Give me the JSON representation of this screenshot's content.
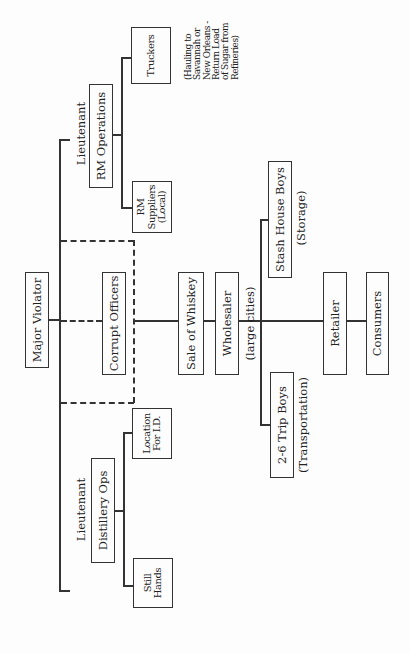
{
  "diagram": {
    "orientation": "rotated 90 degrees counter-clockwise",
    "nodes": {
      "major_violator": "Major Violator",
      "lieutenant_rm": {
        "title": "Lieutenant",
        "label": "RM Operations"
      },
      "lieutenant_distillery": {
        "title": "Lieutenant",
        "label": "Distillery Ops"
      },
      "corrupt_officers": "Corrupt Officers",
      "truckers": "Truckers",
      "truckers_note": [
        "(Hauling to",
        "Savannah or",
        "New Orleans -",
        "Return Load",
        "of Sugar from",
        "Refineries)"
      ],
      "rm_suppliers": [
        "RM",
        "Suppliers",
        "(Local)"
      ],
      "location_for_id": [
        "Location",
        "For I.D."
      ],
      "still_hands": [
        "Still",
        "Hands"
      ],
      "sale_of_whiskey": "Sale of Whiskey",
      "wholesaler": "Wholesaler",
      "wholesaler_note": "(large cities)",
      "stash_house_boys": "Stash House Boys",
      "stash_house_note": "(Storage)",
      "trip_boys": "2-6 Trip Boys",
      "trip_boys_note": "(Transportation)",
      "retailer": "Retailer",
      "consumers": "Consumers"
    },
    "edges": [
      [
        "Major Violator",
        "Lieutenant RM Operations"
      ],
      [
        "Major Violator",
        "Lieutenant Distillery Ops"
      ],
      [
        "Major Violator",
        "Corrupt Officers"
      ],
      [
        "Lieutenant RM Operations",
        "Truckers"
      ],
      [
        "Lieutenant RM Operations",
        "RM Suppliers"
      ],
      [
        "Lieutenant Distillery Ops",
        "Location For I.D."
      ],
      [
        "Lieutenant Distillery Ops",
        "Still Hands"
      ],
      [
        "Corrupt Officers",
        "Sale of Whiskey"
      ],
      [
        "Sale of Whiskey",
        "Wholesaler"
      ],
      [
        "Wholesaler",
        "Stash House Boys"
      ],
      [
        "Wholesaler",
        "2-6 Trip Boys"
      ],
      [
        "Wholesaler",
        "Retailer"
      ],
      [
        "Retailer",
        "Consumers"
      ]
    ],
    "colors": {
      "line": "#333333",
      "background": "#fdfdfd"
    }
  }
}
